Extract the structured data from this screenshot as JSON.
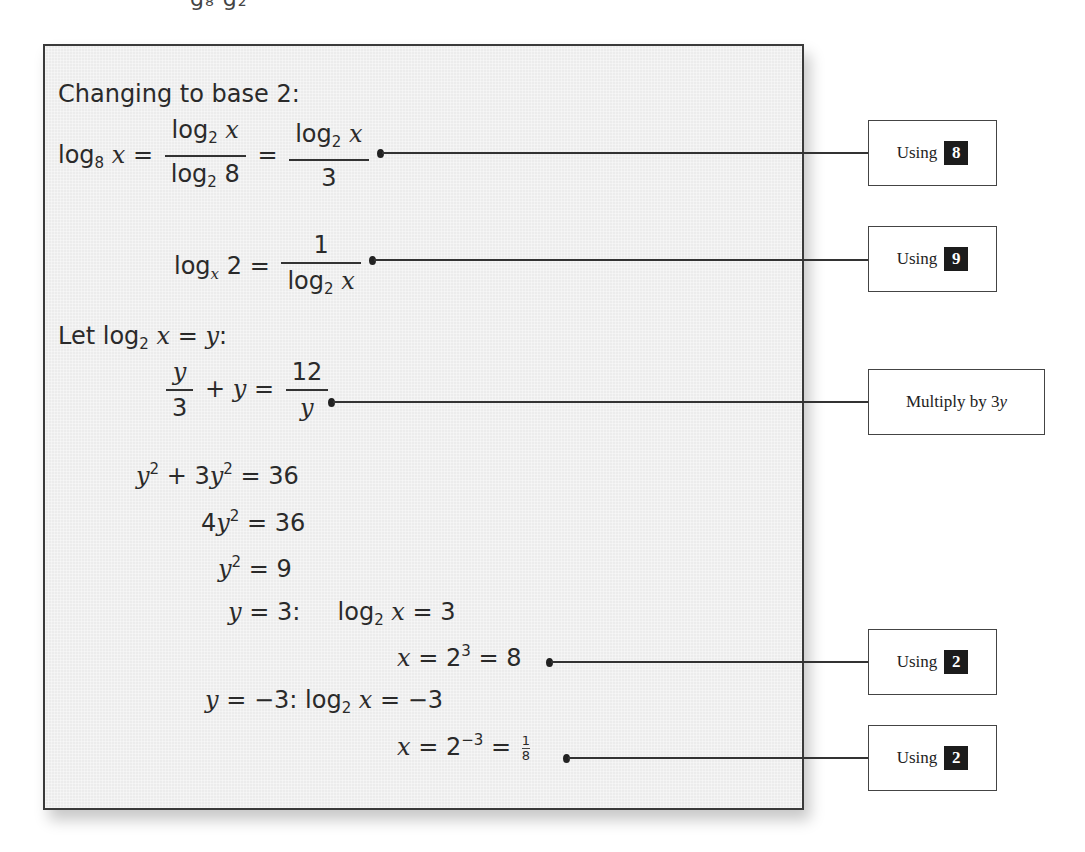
{
  "top_crop_text": "g₈        g₂",
  "panel": {
    "heading": "Changing to base 2:",
    "lines": [
      {
        "id": "l1",
        "lhs": "log",
        "lhs_sub": "8",
        "lhs_var": "x",
        "eq": "=",
        "frac1_num": "log",
        "frac1_num_sub": "2",
        "frac1_num_var": "x",
        "frac1_den": "log",
        "frac1_den_sub": "2",
        "frac1_den_val": "8",
        "eq2": "=",
        "frac2_num": "log",
        "frac2_num_sub": "2",
        "frac2_num_var": "x",
        "frac2_den": "3"
      },
      {
        "id": "l2",
        "lhs": "log",
        "lhs_sub": "x",
        "lhs_val": "2",
        "eq": "=",
        "frac_num": "1",
        "frac_den": "log",
        "frac_den_sub": "2",
        "frac_den_var": "x"
      },
      {
        "id": "l3",
        "prefix": "Let",
        "log": "log",
        "sub": "2",
        "var": "x",
        "eq": "=",
        "rhs": "y",
        "suffix": ":"
      },
      {
        "id": "l4",
        "frac1_num": "y",
        "frac1_den": "3",
        "plus": "+",
        "var": "y",
        "eq": "=",
        "frac2_num": "12",
        "frac2_den": "y"
      },
      {
        "id": "l5",
        "a": "y",
        "a_sup": "2",
        "plus": "+ 3",
        "b": "y",
        "b_sup": "2",
        "eq": "= 36"
      },
      {
        "id": "l6",
        "coef": "4",
        "a": "y",
        "a_sup": "2",
        "eq": "= 36"
      },
      {
        "id": "l7",
        "a": "y",
        "a_sup": "2",
        "eq": "= 9"
      },
      {
        "id": "l8",
        "var": "y",
        "eq": "= 3:",
        "log": "log",
        "sub": "2",
        "x": "x",
        "rhs": "= 3"
      },
      {
        "id": "l9",
        "x": "x",
        "eq": "= 2",
        "exp": "3",
        "rhs": "= 8"
      },
      {
        "id": "l10",
        "var": "y",
        "eq": "= −3:",
        "log": "log",
        "sub": "2",
        "x": "x",
        "rhs": "= −3"
      },
      {
        "id": "l11",
        "x": "x",
        "eq": "= 2",
        "exp": "−3",
        "eq2": "=",
        "frac_num": "1",
        "frac_den": "8"
      }
    ]
  },
  "callouts": [
    {
      "label": "Using",
      "badge": "8"
    },
    {
      "label": "Using",
      "badge": "9"
    },
    {
      "label": "Multiply by 3",
      "label_var": "y",
      "badge": ""
    },
    {
      "label": "Using",
      "badge": "2"
    },
    {
      "label": "Using",
      "badge": "2"
    }
  ],
  "colors": {
    "panel_bg": "#ececec",
    "panel_border": "#3a3a3a",
    "badge_bg": "#1c1c1c",
    "badge_fg": "#ffffff",
    "text": "#2a2a2a"
  }
}
